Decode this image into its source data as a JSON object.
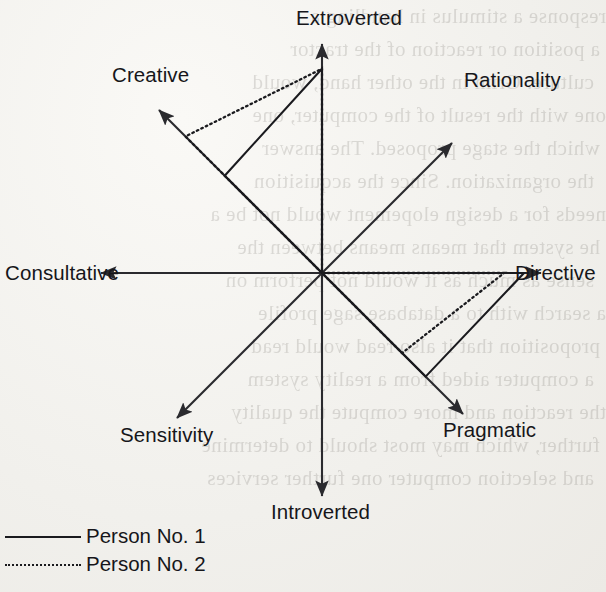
{
  "diagram": {
    "axis_labels": {
      "extroverted": "Extroverted",
      "rationality": "Rationality",
      "directive": "Directive",
      "pragmatic": "Pragmatic",
      "introverted": "Introverted",
      "sensitivity": "Sensitivity",
      "consultative": "Consultative",
      "creative": "Creative"
    },
    "line_color": "#1a1a1e",
    "axis_color": "#2a2a2e",
    "paper_color": "#f1f0ec"
  },
  "legend": {
    "entries": [
      {
        "label": "Person No. 1",
        "style": "solid"
      },
      {
        "label": "Person No. 2",
        "style": "dotted"
      }
    ]
  },
  "chart_data": {
    "type": "radar",
    "subtitle": "",
    "xlabel": "",
    "ylabel": "",
    "grid": false,
    "legend_position": "bottom-left",
    "axis_order_clockwise_from_top": [
      "Extroverted",
      "Rationality",
      "Directive",
      "Pragmatic",
      "Introverted",
      "Sensitivity",
      "Consultative",
      "Creative"
    ],
    "axis_angles_deg_from_east_ccw": [
      90,
      45,
      0,
      315,
      270,
      225,
      180,
      135
    ],
    "axis_max": 1.0,
    "axis_length_px": 222,
    "center_px": {
      "x": 322,
      "y": 273
    },
    "categories": [
      "Extroverted",
      "Rationality",
      "Directive",
      "Pragmatic",
      "Introverted",
      "Sensitivity",
      "Consultative",
      "Creative"
    ],
    "series": [
      {
        "name": "Person No. 1",
        "style": "solid",
        "values": [
          0.92,
          0.0,
          0.91,
          0.66,
          0.0,
          0.0,
          0.0,
          0.62
        ]
      },
      {
        "name": "Person No. 2",
        "style": "dotted",
        "values": [
          0.92,
          0.0,
          0.82,
          0.51,
          0.0,
          0.0,
          0.0,
          0.87
        ]
      }
    ]
  },
  "ghost_text": {
    "lines": [
      "response a stimulus in handling a",
      "a position or reaction of the tractor",
      "culture. Grim in the other hand, would",
      "one with the result of the computer, one",
      "which the stage proposed. The answer",
      "the organization. Since the acquisition",
      "needs for a design elopement would not be a",
      "he system that means means between the",
      "sense as much as it would not perform on",
      "a search with to a database sage profile",
      "proposition that it also read would read",
      "a computer aided from a reality system",
      "the reaction and more compute the quality",
      "further, which may most should to determine",
      "and selection computer one further services"
    ]
  }
}
